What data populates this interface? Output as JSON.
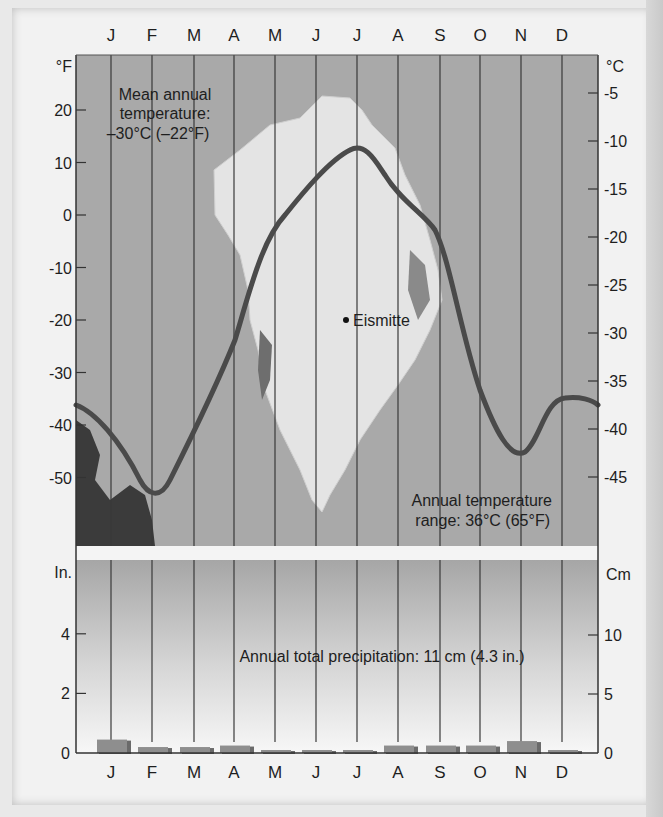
{
  "colors": {
    "plot_bg": "#a9a9a9",
    "curve": "#4a4a4a",
    "bar": "#8e8e8e",
    "grid": "#3a3a3a",
    "separator": "#f4f4f4"
  },
  "temperature_panel": {
    "left_unit": "°F",
    "right_unit": "°C",
    "months_top": [
      "J",
      "F",
      "M",
      "A",
      "M",
      "J",
      "J",
      "A",
      "S",
      "O",
      "N",
      "D"
    ],
    "left_ticks": [
      "20",
      "10",
      "0",
      "-10",
      "-20",
      "-30",
      "-40",
      "-50"
    ],
    "right_ticks": [
      "-5",
      "-10",
      "-15",
      "-20",
      "-25",
      "-30",
      "-35",
      "-40",
      "-45"
    ],
    "mean_label_line1": "Mean annual",
    "mean_label_line2": "temperature:",
    "mean_label_line3": "–30°C (–22°F)",
    "station_label": "Eismitte",
    "range_label_line1": "Annual temperature",
    "range_label_line2": "range: 36°C (65°F)"
  },
  "precip_panel": {
    "left_unit": "In.",
    "right_unit": "Cm",
    "left_ticks": [
      "4",
      "2",
      "0"
    ],
    "right_ticks": [
      "10",
      "5",
      "0"
    ],
    "total_label": "Annual total precipitation: 11 cm (4.3 in.)",
    "months_bottom": [
      "J",
      "F",
      "M",
      "A",
      "M",
      "J",
      "J",
      "A",
      "S",
      "O",
      "N",
      "D"
    ]
  },
  "chart_data": [
    {
      "type": "line",
      "title": "Eismitte, Greenland – monthly temperature",
      "xlabel": "Month",
      "ylabel": "Temperature (°F / °C)",
      "categories": [
        "J",
        "F",
        "M",
        "A",
        "M",
        "J",
        "J",
        "A",
        "S",
        "O",
        "N",
        "D"
      ],
      "series": [
        {
          "name": "Temperature (°F)",
          "values": [
            -40,
            -53,
            -35,
            -22,
            -2,
            7,
            13,
            5,
            -7,
            -35,
            -45,
            -35
          ]
        },
        {
          "name": "Temperature (°C)",
          "values": [
            -40,
            -47,
            -37,
            -30,
            -19,
            -14,
            -11,
            -15,
            -22,
            -37,
            -43,
            -37
          ]
        }
      ],
      "ylim_f": [
        -60,
        28
      ],
      "ylim_c": [
        -51,
        -2
      ],
      "annotations": [
        "Mean annual temperature: –30°C (–22°F)",
        "Annual temperature range: 36°C (65°F)",
        "Eismitte"
      ],
      "grid": true
    },
    {
      "type": "bar",
      "title": "Eismitte, Greenland – monthly precipitation",
      "categories": [
        "J",
        "F",
        "M",
        "A",
        "M",
        "J",
        "J",
        "A",
        "S",
        "O",
        "N",
        "D"
      ],
      "series": [
        {
          "name": "Precipitation (in.)",
          "values": [
            0.45,
            0.2,
            0.2,
            0.25,
            0.1,
            0.1,
            0.1,
            0.25,
            0.25,
            0.25,
            0.4,
            0.1
          ]
        },
        {
          "name": "Precipitation (cm)",
          "values": [
            1.1,
            0.5,
            0.5,
            0.6,
            0.25,
            0.25,
            0.25,
            0.6,
            0.6,
            0.6,
            1.0,
            0.25
          ]
        }
      ],
      "ylabel": "In. / Cm",
      "ylim_in": [
        0,
        6.5
      ],
      "ylim_cm": [
        0,
        16.5
      ],
      "annotations": [
        "Annual total precipitation: 11 cm (4.3 in.)"
      ]
    }
  ]
}
